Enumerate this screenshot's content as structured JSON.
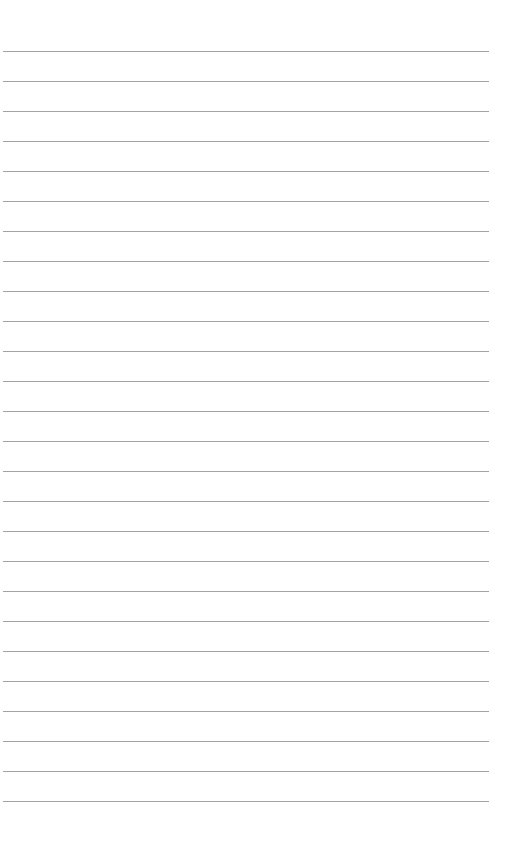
{
  "page": {
    "type": "blank-lined-paper",
    "background_color": "#ffffff",
    "line_color": "#a3a3a3",
    "line_count": 26,
    "first_line_y": 51,
    "line_spacing": 30,
    "line_left": 3,
    "line_right": 489
  }
}
